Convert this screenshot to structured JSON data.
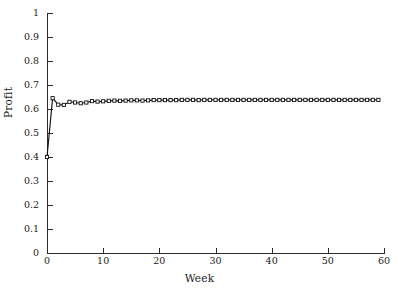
{
  "chart_data": {
    "type": "line",
    "title": "",
    "xlabel": "Week",
    "ylabel": "Profit",
    "xlim": [
      0,
      60
    ],
    "ylim": [
      0,
      1
    ],
    "grid": false,
    "legend": null,
    "marker": "open-square",
    "line_color": "#111111",
    "marker_face_color": "#ffffff",
    "xticks": [
      0,
      10,
      20,
      30,
      40,
      50,
      60
    ],
    "xtick_labels": [
      "0",
      "10",
      "20",
      "30",
      "40",
      "50",
      "60"
    ],
    "yticks": [
      0,
      0.1,
      0.2,
      0.3,
      0.4,
      0.5,
      0.6,
      0.7,
      0.8,
      0.9,
      1
    ],
    "ytick_labels": [
      "0",
      "0.1",
      "0.2",
      "0.3",
      "0.4",
      "0.5",
      "0.6",
      "0.7",
      "0.8",
      "0.9",
      "1"
    ],
    "x": [
      0,
      1,
      2,
      3,
      4,
      5,
      6,
      7,
      8,
      9,
      10,
      11,
      12,
      13,
      14,
      15,
      16,
      17,
      18,
      19,
      20,
      21,
      22,
      23,
      24,
      25,
      26,
      27,
      28,
      29,
      30,
      31,
      32,
      33,
      34,
      35,
      36,
      37,
      38,
      39,
      40,
      41,
      42,
      43,
      44,
      45,
      46,
      47,
      48,
      49,
      50,
      51,
      52,
      53,
      54,
      55,
      56,
      57,
      58,
      59
    ],
    "values": [
      0.4,
      0.645,
      0.618,
      0.617,
      0.63,
      0.627,
      0.624,
      0.627,
      0.633,
      0.631,
      0.632,
      0.634,
      0.635,
      0.634,
      0.635,
      0.636,
      0.636,
      0.635,
      0.636,
      0.637,
      0.637,
      0.637,
      0.637,
      0.637,
      0.638,
      0.638,
      0.638,
      0.637,
      0.638,
      0.638,
      0.638,
      0.638,
      0.638,
      0.638,
      0.638,
      0.638,
      0.638,
      0.638,
      0.638,
      0.638,
      0.638,
      0.638,
      0.638,
      0.638,
      0.638,
      0.638,
      0.638,
      0.638,
      0.638,
      0.638,
      0.638,
      0.638,
      0.638,
      0.638,
      0.638,
      0.638,
      0.638,
      0.638,
      0.638,
      0.638
    ]
  }
}
